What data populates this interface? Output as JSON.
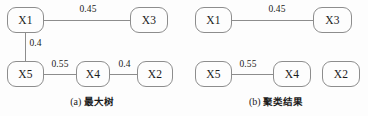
{
  "figure": {
    "width": 368,
    "height": 116,
    "background": "#fdfdfd",
    "stroke_color": "#8d8d8d",
    "text_color": "#1b1b1b"
  },
  "panels": [
    {
      "id": "a",
      "caption_index": "(a)",
      "caption_text": "最大树",
      "nodes": [
        {
          "id": "X1",
          "label": "X1",
          "x": 7,
          "y": 7,
          "w": 37,
          "h": 26
        },
        {
          "id": "X3",
          "label": "X3",
          "x": 130,
          "y": 7,
          "w": 38,
          "h": 26
        },
        {
          "id": "X5",
          "label": "X5",
          "x": 7,
          "y": 61,
          "w": 37,
          "h": 26
        },
        {
          "id": "X4",
          "label": "X4",
          "x": 76,
          "y": 61,
          "w": 34,
          "h": 26
        },
        {
          "id": "X2",
          "label": "X2",
          "x": 137,
          "y": 61,
          "w": 36,
          "h": 26
        }
      ],
      "edges": [
        {
          "from": "X1",
          "to": "X3",
          "weight": "0.45",
          "orientation": "h",
          "x": 44,
          "y": 20,
          "length": 86,
          "label_x": 88,
          "label_y": 6
        },
        {
          "from": "X1",
          "to": "X5",
          "weight": "0.4",
          "orientation": "v",
          "x": 25,
          "y": 33,
          "length": 28,
          "label_x": 30,
          "label_y": 39
        },
        {
          "from": "X5",
          "to": "X4",
          "weight": "0.55",
          "orientation": "h",
          "x": 44,
          "y": 74,
          "length": 32,
          "label_x": 61,
          "label_y": 60
        },
        {
          "from": "X4",
          "to": "X2",
          "weight": "0.4",
          "orientation": "h",
          "x": 110,
          "y": 74,
          "length": 27,
          "label_x": 124,
          "label_y": 60
        }
      ]
    },
    {
      "id": "b",
      "caption_index": "(b)",
      "caption_text": "聚类结果",
      "nodes": [
        {
          "id": "X1",
          "label": "X1",
          "x": 11,
          "y": 7,
          "w": 37,
          "h": 26
        },
        {
          "id": "X3",
          "label": "X3",
          "x": 129,
          "y": 7,
          "w": 39,
          "h": 26
        },
        {
          "id": "X5",
          "label": "X5",
          "x": 11,
          "y": 61,
          "w": 37,
          "h": 26
        },
        {
          "id": "X4",
          "label": "X4",
          "x": 89,
          "y": 61,
          "w": 38,
          "h": 26
        },
        {
          "id": "X2",
          "label": "X2",
          "x": 138,
          "y": 61,
          "w": 38,
          "h": 26
        }
      ],
      "edges": [
        {
          "from": "X1",
          "to": "X3",
          "weight": "0.45",
          "orientation": "h",
          "x": 48,
          "y": 20,
          "length": 81,
          "label_x": 93,
          "label_y": 6
        },
        {
          "from": "X5",
          "to": "X4",
          "weight": "0.55",
          "orientation": "h",
          "x": 48,
          "y": 74,
          "length": 41,
          "label_x": 65,
          "label_y": 60
        }
      ]
    }
  ]
}
